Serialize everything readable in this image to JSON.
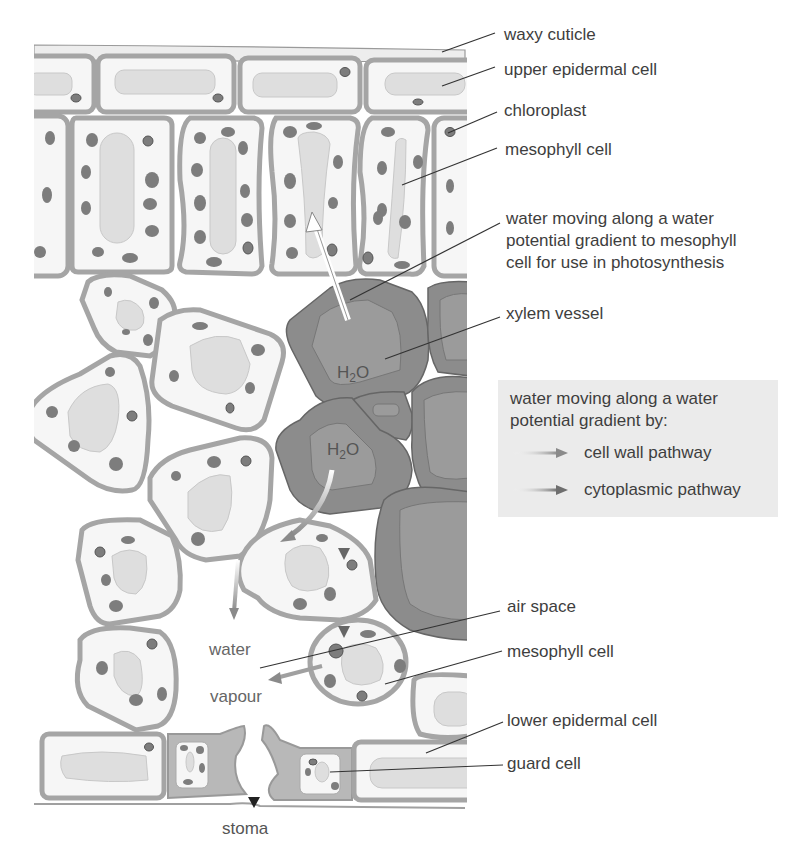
{
  "figure": {
    "colors": {
      "background": "#ffffff",
      "cell_wall": "#a9a9a9",
      "cell_fill": "#f6f6f6",
      "vacuole": "#dcdcdc",
      "chloroplast": "#7d7d7d",
      "xylem": "#8c8c8c",
      "xylem_inner": "#9b9b9b",
      "legend_bg": "#ebebeb",
      "label_text": "#3e3e3e",
      "leader_line": "#333333",
      "cell_wall_pathway_arrow": "#8a8a8a",
      "cytoplasmic_pathway_arrow": "#777777"
    }
  },
  "labels": {
    "waxy_cuticle": "waxy cuticle",
    "upper_epidermal_cell": "upper epidermal cell",
    "chloroplast": "chloroplast",
    "mesophyll_cell_upper": "mesophyll cell",
    "water_to_mesophyll": "water moving along a water\npotential gradient to mesophyll\ncell for use in photosynthesis",
    "xylem_vessel": "xylem vessel",
    "air_space": "air space",
    "mesophyll_cell_lower": "mesophyll cell",
    "lower_epidermal_cell": "lower epidermal cell",
    "guard_cell": "guard cell"
  },
  "inline_text": {
    "h2o_top": "H",
    "h2o_top_sub": "2",
    "h2o_top_o": "O",
    "h2o_bottom": "H",
    "h2o_bottom_sub": "2",
    "h2o_bottom_o": "O",
    "water": "water",
    "vapour": "vapour",
    "stoma": "stoma"
  },
  "legend": {
    "title": "water moving along a water\npotential gradient by:",
    "items": [
      {
        "label": "cell wall pathway",
        "arrow": "gradient-arrow-light"
      },
      {
        "label": "cytoplasmic pathway",
        "arrow": "gradient-arrow-dark"
      }
    ]
  }
}
